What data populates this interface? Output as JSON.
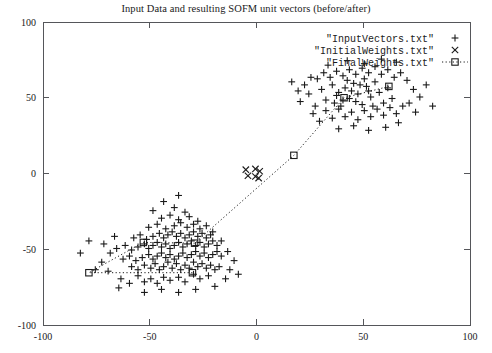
{
  "chart_data": {
    "type": "scatter",
    "title": "Input Data and resulting SOFM unit vectors (before/after)",
    "xlabel": "",
    "ylabel": "",
    "xlim": [
      -100,
      100
    ],
    "ylim": [
      -100,
      100
    ],
    "xticks": [
      -100,
      -50,
      0,
      50,
      100
    ],
    "yticks": [
      -100,
      -50,
      0,
      50,
      100
    ],
    "xtick_labels": [
      "-100",
      "-50",
      "0",
      "50",
      "100"
    ],
    "ytick_labels": [
      "-100",
      "-50",
      "0",
      "50",
      "100"
    ],
    "grid": false,
    "legend_position": "top-right-inside",
    "border": "full-box",
    "series": [
      {
        "name": "\"InputVectors.txt\"",
        "marker": "plus",
        "color": "#1a1a1a",
        "points": [
          [
            -69.5,
            -64.5
          ],
          [
            -63.5,
            -69.5
          ],
          [
            -59.5,
            -72.5
          ],
          [
            -55.5,
            -67.5
          ],
          [
            -52.5,
            -71.5
          ],
          [
            -49.5,
            -69.5
          ],
          [
            -46.5,
            -72.5
          ],
          [
            -43.5,
            -68.5
          ],
          [
            -40.5,
            -70.5
          ],
          [
            -36.5,
            -68.5
          ],
          [
            -33.5,
            -71.5
          ],
          [
            -29.5,
            -66.5
          ],
          [
            -26.5,
            -69.5
          ],
          [
            -22.5,
            -67.5
          ],
          [
            -58.5,
            -61.5
          ],
          [
            -55.5,
            -63.5
          ],
          [
            -52.5,
            -60.5
          ],
          [
            -49.5,
            -62.5
          ],
          [
            -47.5,
            -59.5
          ],
          [
            -45.5,
            -63.5
          ],
          [
            -43.5,
            -61.5
          ],
          [
            -41.5,
            -58.5
          ],
          [
            -39.5,
            -62.5
          ],
          [
            -37.5,
            -59.5
          ],
          [
            -35.5,
            -63.5
          ],
          [
            -33.5,
            -60.5
          ],
          [
            -31.5,
            -62.5
          ],
          [
            -29.5,
            -58.5
          ],
          [
            -27.5,
            -61.5
          ],
          [
            -25.5,
            -59.5
          ],
          [
            -23.5,
            -62.5
          ],
          [
            -21.5,
            -60.5
          ],
          [
            -19.5,
            -63.5
          ],
          [
            -17.5,
            -61.5
          ],
          [
            -62.5,
            -56.5
          ],
          [
            -59.5,
            -54.5
          ],
          [
            -56.5,
            -57.5
          ],
          [
            -53.5,
            -55.5
          ],
          [
            -50.5,
            -53.5
          ],
          [
            -48.5,
            -56.5
          ],
          [
            -46.5,
            -54.5
          ],
          [
            -44.5,
            -52.5
          ],
          [
            -42.5,
            -55.5
          ],
          [
            -40.5,
            -53.5
          ],
          [
            -38.5,
            -56.5
          ],
          [
            -36.5,
            -54.5
          ],
          [
            -34.5,
            -52.5
          ],
          [
            -32.5,
            -55.5
          ],
          [
            -30.5,
            -53.5
          ],
          [
            -28.5,
            -51.5
          ],
          [
            -26.5,
            -54.5
          ],
          [
            -24.5,
            -52.5
          ],
          [
            -22.5,
            -55.5
          ],
          [
            -20.5,
            -53.5
          ],
          [
            -18.5,
            -51.5
          ],
          [
            -16.5,
            -54.5
          ],
          [
            -65.5,
            -49.5
          ],
          [
            -61.5,
            -47.5
          ],
          [
            -58.5,
            -50.5
          ],
          [
            -55.5,
            -48.5
          ],
          [
            -52.5,
            -46.5
          ],
          [
            -50.5,
            -49.5
          ],
          [
            -48.5,
            -47.5
          ],
          [
            -46.5,
            -45.5
          ],
          [
            -44.5,
            -48.5
          ],
          [
            -42.5,
            -46.5
          ],
          [
            -40.5,
            -49.5
          ],
          [
            -38.5,
            -47.5
          ],
          [
            -36.5,
            -45.5
          ],
          [
            -34.5,
            -48.5
          ],
          [
            -32.5,
            -46.5
          ],
          [
            -30.5,
            -44.5
          ],
          [
            -28.5,
            -47.5
          ],
          [
            -26.5,
            -45.5
          ],
          [
            -24.5,
            -48.5
          ],
          [
            -22.5,
            -46.5
          ],
          [
            -20.5,
            -44.5
          ],
          [
            -18.5,
            -47.5
          ],
          [
            -57.5,
            -42.5
          ],
          [
            -54.5,
            -40.5
          ],
          [
            -51.5,
            -43.5
          ],
          [
            -48.5,
            -41.5
          ],
          [
            -45.5,
            -39.5
          ],
          [
            -43.5,
            -42.5
          ],
          [
            -41.5,
            -40.5
          ],
          [
            -39.5,
            -38.5
          ],
          [
            -37.5,
            -41.5
          ],
          [
            -35.5,
            -39.5
          ],
          [
            -33.5,
            -42.5
          ],
          [
            -31.5,
            -40.5
          ],
          [
            -29.5,
            -38.5
          ],
          [
            -27.5,
            -41.5
          ],
          [
            -25.5,
            -39.5
          ],
          [
            -23.5,
            -42.5
          ],
          [
            -21.5,
            -40.5
          ],
          [
            -50.5,
            -35.5
          ],
          [
            -46.5,
            -33.5
          ],
          [
            -42.5,
            -36.5
          ],
          [
            -38.5,
            -34.5
          ],
          [
            -35.5,
            -32.5
          ],
          [
            -32.5,
            -35.5
          ],
          [
            -29.5,
            -33.5
          ],
          [
            -26.5,
            -36.5
          ],
          [
            -23.5,
            -34.5
          ],
          [
            -44.5,
            -29.5
          ],
          [
            -40.5,
            -27.5
          ],
          [
            -36.5,
            -30.5
          ],
          [
            -31.5,
            -28.5
          ],
          [
            -27.5,
            -31.5
          ],
          [
            -48.5,
            -24.5
          ],
          [
            -38.5,
            -22.5
          ],
          [
            -33.5,
            -25.5
          ],
          [
            -43.5,
            -18.5
          ],
          [
            -36.5,
            -14.5
          ],
          [
            -72.5,
            -58.5
          ],
          [
            -75.5,
            -63.5
          ],
          [
            -68.5,
            -52.5
          ],
          [
            -71.5,
            -46.5
          ],
          [
            -66.5,
            -41.5
          ],
          [
            -82.5,
            -52.5
          ],
          [
            -78.5,
            -44.5
          ],
          [
            -64.5,
            -75.5
          ],
          [
            -52.5,
            -78.5
          ],
          [
            -44.5,
            -76.5
          ],
          [
            -36.5,
            -78.5
          ],
          [
            -28.5,
            -76.5
          ],
          [
            -19.5,
            -74.5
          ],
          [
            -14.5,
            -69.5
          ],
          [
            -12.5,
            -63.5
          ],
          [
            -10.5,
            -57.5
          ],
          [
            -13.5,
            -51.5
          ],
          [
            -16.5,
            -44.5
          ],
          [
            -20.5,
            -38.5
          ],
          [
            -8.5,
            -66.5
          ],
          [
            20.5,
            47.5
          ],
          [
            24.5,
            52.5
          ],
          [
            27.5,
            44.5
          ],
          [
            30.5,
            55.5
          ],
          [
            32.5,
            48.5
          ],
          [
            35.5,
            58.5
          ],
          [
            37.5,
            51.5
          ],
          [
            39.5,
            44.5
          ],
          [
            41.5,
            56.5
          ],
          [
            43.5,
            49.5
          ],
          [
            45.5,
            59.5
          ],
          [
            47.5,
            52.5
          ],
          [
            49.5,
            45.5
          ],
          [
            51.5,
            57.5
          ],
          [
            53.5,
            50.5
          ],
          [
            55.5,
            60.5
          ],
          [
            57.5,
            53.5
          ],
          [
            59.5,
            46.5
          ],
          [
            61.5,
            56.5
          ],
          [
            63.5,
            49.5
          ],
          [
            26.5,
            39.5
          ],
          [
            29.5,
            34.5
          ],
          [
            32.5,
            41.5
          ],
          [
            35.5,
            36.5
          ],
          [
            38.5,
            42.5
          ],
          [
            41.5,
            37.5
          ],
          [
            44.5,
            40.5
          ],
          [
            47.5,
            35.5
          ],
          [
            50.5,
            41.5
          ],
          [
            53.5,
            37.5
          ],
          [
            56.5,
            42.5
          ],
          [
            59.5,
            38.5
          ],
          [
            62.5,
            43.5
          ],
          [
            65.5,
            39.5
          ],
          [
            68.5,
            44.5
          ],
          [
            28.5,
            62.5
          ],
          [
            31.5,
            66.5
          ],
          [
            34.5,
            63.5
          ],
          [
            37.5,
            67.5
          ],
          [
            40.5,
            64.5
          ],
          [
            43.5,
            68.5
          ],
          [
            46.5,
            65.5
          ],
          [
            49.5,
            69.5
          ],
          [
            52.5,
            66.5
          ],
          [
            55.5,
            70.5
          ],
          [
            58.5,
            65.5
          ],
          [
            61.5,
            68.5
          ],
          [
            64.5,
            63.5
          ],
          [
            67.5,
            66.5
          ],
          [
            70.5,
            61.5
          ],
          [
            22.5,
            58.5
          ],
          [
            25.5,
            63.5
          ],
          [
            19.5,
            54.5
          ],
          [
            16.5,
            60.5
          ],
          [
            73.5,
            55.5
          ],
          [
            76.5,
            50.5
          ],
          [
            79.5,
            58.5
          ],
          [
            82.5,
            44.5
          ],
          [
            71.5,
            46.5
          ],
          [
            74.5,
            40.5
          ],
          [
            66.5,
            33.5
          ],
          [
            60.5,
            30.5
          ],
          [
            52.5,
            28.5
          ],
          [
            45.5,
            31.5
          ],
          [
            38.5,
            29.5
          ],
          [
            33.5,
            71.5
          ],
          [
            42.5,
            74.5
          ],
          [
            50.5,
            72.5
          ],
          [
            58.5,
            75.5
          ],
          [
            65.5,
            73.5
          ],
          [
            44.5,
            54.5
          ],
          [
            48.5,
            58.5
          ],
          [
            52.5,
            54.5
          ],
          [
            46.5,
            47.5
          ],
          [
            50.5,
            62.5
          ],
          [
            54.5,
            44.5
          ],
          [
            42.5,
            61.5
          ],
          [
            38.5,
            53.5
          ],
          [
            36.5,
            46.5
          ],
          [
            40.5,
            48.5
          ]
        ]
      },
      {
        "name": "\"InitialWeights.txt\"",
        "marker": "cross",
        "color": "#1a1a1a",
        "points": [
          [
            -5.0,
            2.5
          ],
          [
            -0.5,
            3.0
          ],
          [
            1.5,
            1.5
          ],
          [
            -4.0,
            -1.5
          ],
          [
            -0.5,
            -2.0
          ],
          [
            1.0,
            -3.0
          ]
        ]
      },
      {
        "name": "\"FinalWeights.txt\"",
        "marker": "square-dotted-line",
        "color": "#1a1a1a",
        "points": [
          [
            -78.5,
            -65.5
          ],
          [
            -53.0,
            -45.5
          ],
          [
            -30.0,
            -65.5
          ],
          [
            -29.0,
            -46.0
          ],
          [
            17.5,
            12.0
          ],
          [
            41.0,
            50.0
          ],
          [
            62.0,
            57.5
          ]
        ],
        "path_order": [
          2,
          0,
          1,
          3,
          4,
          5,
          6
        ]
      }
    ]
  },
  "legend": {
    "entries": [
      {
        "label": "\"InputVectors.txt\"",
        "marker": "plus"
      },
      {
        "label": "\"InitialWeights.txt\"",
        "marker": "cross"
      },
      {
        "label": "\"FinalWeights.txt\"",
        "marker": "square-dotted"
      }
    ]
  }
}
